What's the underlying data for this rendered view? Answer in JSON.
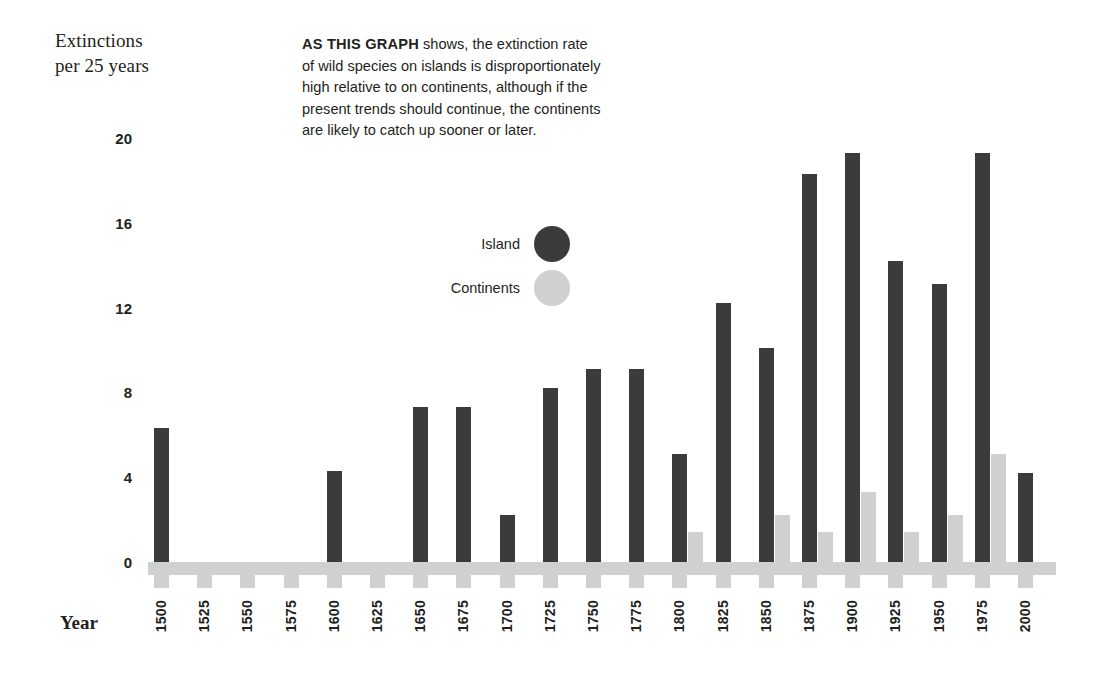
{
  "axis_title_y": "Extinctions\nper 25 years",
  "axis_title_x": "Year",
  "description": {
    "lead": "AS THIS GRAPH",
    "body": " shows, the extinction rate of wild species on islands is disproportionately high relative to on continents, although if the present trends should continue, the continents are likely to catch up sooner or later."
  },
  "legend": {
    "items": [
      {
        "label": "Island",
        "color": "#3b3b3d",
        "marker": "filled-circle"
      },
      {
        "label": "Continents",
        "color": "#cfd0d0",
        "marker": "filled-circle"
      }
    ]
  },
  "colors": {
    "island": "#3b3b3d",
    "continents": "#cfd0d0",
    "text": "#231f20",
    "background": "#ffffff"
  },
  "chart_data": {
    "type": "bar",
    "title": "",
    "subtitle": "",
    "xlabel": "Year",
    "ylabel": "Extinctions per 25 years",
    "ylim": [
      0,
      20
    ],
    "yticks": [
      0,
      4,
      8,
      12,
      16,
      20
    ],
    "grid": false,
    "legend_position": "upper-center",
    "categories": [
      "1500",
      "1525",
      "1550",
      "1575",
      "1600",
      "1625",
      "1650",
      "1675",
      "1700",
      "1725",
      "1750",
      "1775",
      "1800",
      "1825",
      "1850",
      "1875",
      "1900",
      "1925",
      "1950",
      "1975",
      "2000"
    ],
    "series": [
      {
        "name": "Island",
        "color": "#3b3b3d",
        "values": [
          6.3,
          0,
          0,
          0,
          4.3,
          0,
          7.3,
          7.3,
          2.2,
          8.2,
          9.1,
          9.1,
          5.1,
          12.2,
          10.1,
          18.3,
          19.3,
          14.2,
          13.1,
          19.3,
          4.2
        ]
      },
      {
        "name": "Continents",
        "color": "#cfd0d0",
        "values": [
          0,
          0,
          0,
          0,
          0,
          0,
          0,
          0,
          0,
          0,
          0,
          0,
          1.4,
          0,
          2.2,
          1.4,
          3.3,
          1.4,
          2.2,
          5.1,
          0
        ]
      }
    ]
  }
}
